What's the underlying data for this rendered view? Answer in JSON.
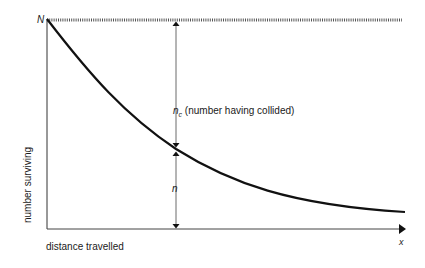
{
  "diagram": {
    "type": "survival-curve",
    "labels": {
      "N": "N",
      "nc_symbol": "n",
      "nc_subscript": "c",
      "nc_desc": "(number having collided)",
      "n": "n",
      "x": "x",
      "ylabel": "number surviving",
      "xlabel": "distance travelled"
    },
    "colors": {
      "curve": "#111111",
      "axis": "#333333",
      "dashed": "#555555",
      "text": "#1a1a1a"
    },
    "curve": "exponential decay from N at x=0 toward asymptote",
    "annotations": [
      "dashed horizontal line at level N",
      "double-headed arrow between N level and curve labelled n_c",
      "double-headed arrow between curve and x-axis labelled n"
    ]
  }
}
